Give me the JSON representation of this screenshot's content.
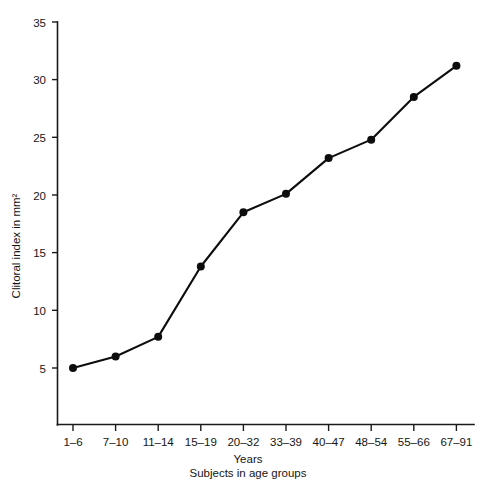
{
  "chart_data": {
    "type": "line",
    "title": "",
    "xlabel": "Years",
    "xlabel_secondary": "Subjects in age groups",
    "ylabel": "Clitoral index in mm²",
    "categories": [
      "1–6",
      "7–10",
      "11–14",
      "15–19",
      "20–32",
      "33–39",
      "40–47",
      "48–54",
      "55–66",
      "67–91"
    ],
    "values": [
      5.0,
      6.0,
      7.7,
      13.8,
      18.5,
      20.1,
      23.2,
      24.8,
      28.5,
      31.2
    ],
    "series": [
      {
        "name": "Clitoral index",
        "values": [
          5.0,
          6.0,
          7.7,
          13.8,
          18.5,
          20.1,
          23.2,
          24.8,
          28.5,
          31.2
        ]
      }
    ],
    "ylim": [
      0,
      35
    ],
    "yticks": [
      5,
      10,
      15,
      20,
      25,
      30,
      35
    ],
    "ytick_labels": [
      "5",
      "10",
      "15",
      "20",
      "25",
      "30",
      "35"
    ],
    "grid": false,
    "legend": false,
    "legend_position": "none",
    "marker": "filled-circle",
    "line_color": "#0d0d0d",
    "marker_color": "#0d0d0d",
    "background_color": "#ffffff"
  },
  "axes": {
    "y_axis_name": "y-axis",
    "x_axis_name": "x-axis"
  }
}
